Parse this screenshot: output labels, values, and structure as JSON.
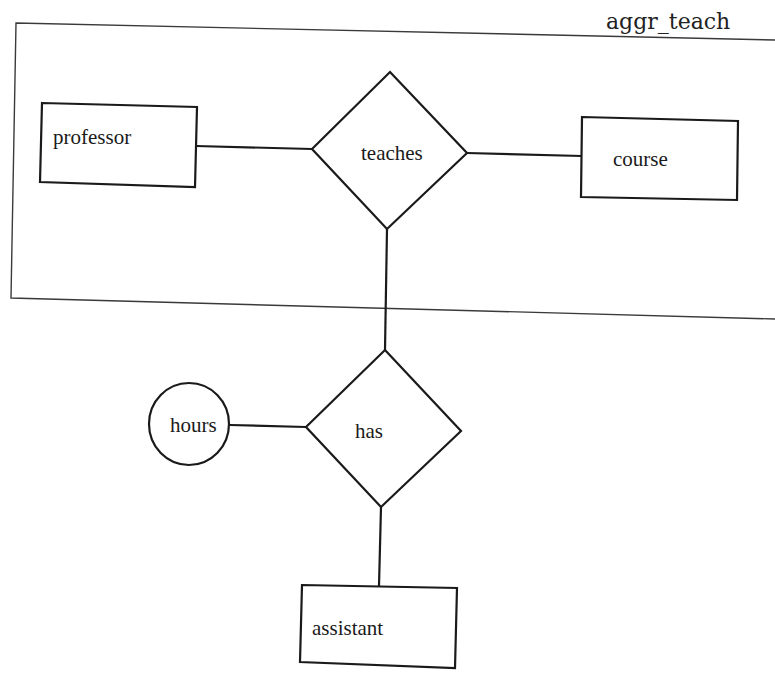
{
  "diagram": {
    "type": "er-diagram",
    "aggregation": {
      "label": "aggr_teach",
      "contains": [
        "professor",
        "teaches",
        "course"
      ]
    },
    "entities": [
      {
        "id": "professor",
        "label": "professor"
      },
      {
        "id": "course",
        "label": "course"
      },
      {
        "id": "assistant",
        "label": "assistant"
      }
    ],
    "relationships": [
      {
        "id": "teaches",
        "label": "teaches",
        "connects": [
          "professor",
          "course"
        ]
      },
      {
        "id": "has",
        "label": "has",
        "connects": [
          "aggr_teach",
          "assistant"
        ]
      }
    ],
    "attributes": [
      {
        "id": "hours",
        "label": "hours",
        "of": "has"
      }
    ],
    "colors": {
      "stroke": "#1a1a1a",
      "background": "#ffffff"
    }
  }
}
